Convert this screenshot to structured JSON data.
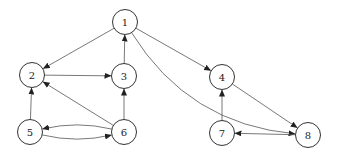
{
  "diagram": {
    "type": "directed-graph",
    "node_radius": 12.5,
    "colors": {
      "stroke": "#333333",
      "edge": "#555555",
      "background": "#ffffff",
      "text": "#222222"
    },
    "nodes": [
      {
        "id": "1",
        "label": "1",
        "x": 125,
        "y": 22
      },
      {
        "id": "2",
        "label": "2",
        "x": 32,
        "y": 75
      },
      {
        "id": "3",
        "label": "3",
        "x": 124,
        "y": 76
      },
      {
        "id": "4",
        "label": "4",
        "x": 222,
        "y": 77
      },
      {
        "id": "5",
        "label": "5",
        "x": 30,
        "y": 132
      },
      {
        "id": "6",
        "label": "6",
        "x": 124,
        "y": 132
      },
      {
        "id": "7",
        "label": "7",
        "x": 222,
        "y": 133
      },
      {
        "id": "8",
        "label": "8",
        "x": 308,
        "y": 135
      }
    ],
    "edges": [
      {
        "from": "1",
        "to": "2",
        "curve": 0
      },
      {
        "from": "1",
        "to": "4",
        "curve": 0
      },
      {
        "from": "1",
        "to": "8",
        "curve": -0.25
      },
      {
        "from": "2",
        "to": "3",
        "curve": 0
      },
      {
        "from": "3",
        "to": "1",
        "curve": 0
      },
      {
        "from": "5",
        "to": "2",
        "curve": 0
      },
      {
        "from": "5",
        "to": "6",
        "curve": -0.12
      },
      {
        "from": "6",
        "to": "5",
        "curve": -0.12
      },
      {
        "from": "6",
        "to": "2",
        "curve": 0
      },
      {
        "from": "6",
        "to": "3",
        "curve": 0
      },
      {
        "from": "4",
        "to": "8",
        "curve": 0
      },
      {
        "from": "8",
        "to": "7",
        "curve": 0
      },
      {
        "from": "7",
        "to": "4",
        "curve": 0
      }
    ]
  }
}
